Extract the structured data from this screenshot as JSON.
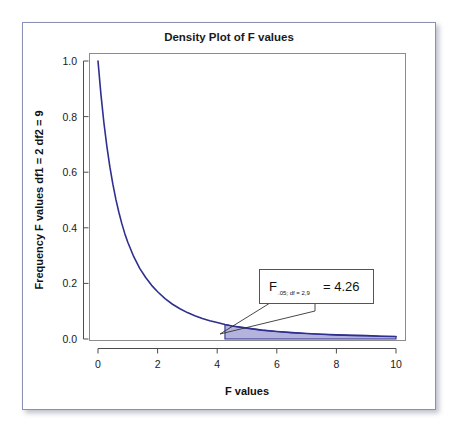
{
  "figure": {
    "title": "Density Plot of F values",
    "background": "#ffffff",
    "border_color": "#8a8fb5"
  },
  "annotation": {
    "symbol": "F",
    "subscript": ".05; df = 2,9",
    "equals_value": "= 4.26",
    "critical_value": 4.26,
    "box_border_color": "#555555"
  },
  "chart_data": {
    "type": "line",
    "title": "Density Plot of F values",
    "xlabel": "F values",
    "ylabel": "Frequency F values df1 = 2 df2 = 9",
    "xlim": [
      0,
      10
    ],
    "ylim": [
      0.0,
      1.0
    ],
    "grid": false,
    "legend": null,
    "xticks": [
      0,
      2,
      4,
      6,
      8,
      10
    ],
    "xtick_labels": [
      "0",
      "2",
      "4",
      "6",
      "8",
      "10"
    ],
    "yticks": [
      0.0,
      0.2,
      0.4,
      0.6,
      0.8,
      1.0
    ],
    "ytick_labels": [
      "0.0",
      "0.2",
      "0.4",
      "0.6",
      "0.8",
      "1.0"
    ],
    "line_color": "#2f2f8f",
    "fill_color": "#b3b3dd",
    "distribution": "F distribution, df1 = 2, df2 = 9",
    "shaded_region": {
      "label": "upper tail alpha = .05",
      "x_start": 4.26,
      "x_end": 10
    },
    "series": [
      {
        "name": "F density (df1 = 2, df2 = 9)",
        "x": [
          0.0,
          0.1,
          0.2,
          0.3,
          0.4,
          0.5,
          0.6,
          0.7,
          0.8,
          0.9,
          1.0,
          1.2,
          1.4,
          1.6,
          1.8,
          2.0,
          2.25,
          2.5,
          2.75,
          3.0,
          3.25,
          3.5,
          3.75,
          4.0,
          4.26,
          4.5,
          5.0,
          5.5,
          6.0,
          6.5,
          7.0,
          7.5,
          8.0,
          8.5,
          9.0,
          9.5,
          10.0
        ],
        "y": [
          1.0,
          0.878,
          0.776,
          0.691,
          0.618,
          0.556,
          0.502,
          0.456,
          0.415,
          0.379,
          0.348,
          0.296,
          0.254,
          0.221,
          0.193,
          0.17,
          0.145,
          0.125,
          0.109,
          0.095,
          0.084,
          0.074,
          0.066,
          0.059,
          0.052,
          0.047,
          0.039,
          0.032,
          0.027,
          0.023,
          0.02,
          0.017,
          0.015,
          0.013,
          0.012,
          0.01,
          0.009
        ]
      }
    ]
  }
}
